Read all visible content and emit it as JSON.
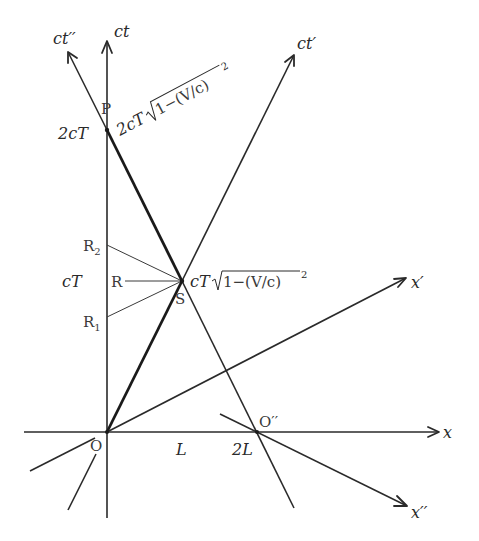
{
  "diagram": {
    "type": "Minkowski spacetime diagram",
    "axes": {
      "ct": "ct",
      "x": "x",
      "ct_prime": "ct′",
      "x_prime": "x′",
      "ct_double_prime": "ct′′",
      "x_double_prime": "x′′"
    },
    "points": {
      "O": "O",
      "O_double_prime": "O′′",
      "P": "P",
      "S": "S",
      "R": "R",
      "R1": "R",
      "R1_sub": "1",
      "R2": "R",
      "R2_sub": "2"
    },
    "tick_labels": {
      "cT": "cT",
      "two_cT": "2cT",
      "L": "L",
      "two_L": "2L"
    },
    "formulas": {
      "S_time_prefix": "cT",
      "S_time_radicand": "1−(V/c)",
      "S_time_exp": "2",
      "P_time_prefix": "2cT",
      "P_time_radicand": "1−(V/c)",
      "P_time_exp": "2"
    },
    "colors": {
      "line": "#2a2a2a",
      "background": "#ffffff"
    }
  }
}
